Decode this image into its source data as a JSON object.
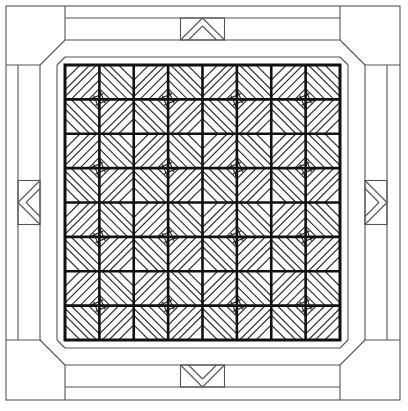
{
  "pattern": {
    "name": "diamond log-cabin quilt with border and corner blocks",
    "grid_rows": 8,
    "grid_cols": 8,
    "block_size_cells": 2,
    "nested_diamonds_per_block": 4,
    "border_strips_per_side": 3,
    "corner_blocks": 4,
    "border_motifs": [
      "chevron-up",
      "chevron-right",
      "chevron-down",
      "chevron-left"
    ]
  },
  "colors": {
    "background": "#ffffff",
    "grid_line": "#111111",
    "detail_line": "#333333",
    "border_line": "#555555"
  }
}
